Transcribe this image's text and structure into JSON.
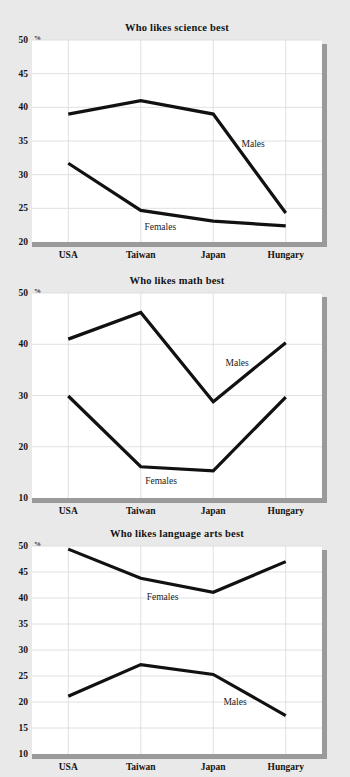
{
  "page": {
    "background_color": "#e9e9e9",
    "plot_background_color": "#ffffff",
    "line_color": "#111111",
    "shadow_color": "#9a9a9a",
    "gridline_color": "#d8d8d8",
    "percent_symbol": "%"
  },
  "chart_data": [
    {
      "type": "line",
      "title": "Who likes science best",
      "xlabel": "",
      "ylabel": "%",
      "categories": [
        "USA",
        "Taiwan",
        "Japan",
        "Hungary"
      ],
      "ylim": [
        20,
        50
      ],
      "yticks": [
        20,
        25,
        30,
        35,
        40,
        45,
        50
      ],
      "grid": true,
      "legend_position": "inline-annotation",
      "series": [
        {
          "name": "Males",
          "values": [
            39,
            41,
            39,
            24.3
          ]
        },
        {
          "name": "Females",
          "values": [
            31.7,
            24.7,
            23.1,
            22.4
          ]
        }
      ],
      "annotations": [
        {
          "text": "Males",
          "x": 2.55,
          "y": 34.6
        },
        {
          "text": "Females",
          "x": 1.27,
          "y": 22.2
        }
      ]
    },
    {
      "type": "line",
      "title": "Who likes math best",
      "xlabel": "",
      "ylabel": "%",
      "categories": [
        "USA",
        "Taiwan",
        "Japan",
        "Hungary"
      ],
      "ylim": [
        10,
        50
      ],
      "yticks": [
        10,
        20,
        30,
        40,
        50
      ],
      "grid": true,
      "legend_position": "inline-annotation",
      "series": [
        {
          "name": "Males",
          "values": [
            41,
            46.2,
            28.8,
            40.3
          ]
        },
        {
          "name": "Females",
          "values": [
            29.9,
            16.1,
            15.3,
            29.7
          ]
        }
      ],
      "annotations": [
        {
          "text": "Males",
          "x": 2.33,
          "y": 36.4
        },
        {
          "text": "Females",
          "x": 1.28,
          "y": 13.4
        }
      ]
    },
    {
      "type": "line",
      "title": "Who likes language arts best",
      "xlabel": "",
      "ylabel": "%",
      "categories": [
        "USA",
        "Taiwan",
        "Japan",
        "Hungary"
      ],
      "ylim": [
        10,
        50
      ],
      "yticks": [
        10,
        15,
        20,
        25,
        30,
        35,
        40,
        45,
        50
      ],
      "grid": true,
      "legend_position": "inline-annotation",
      "series": [
        {
          "name": "Females",
          "values": [
            49.4,
            43.8,
            41.1,
            47.0
          ]
        },
        {
          "name": "Males",
          "values": [
            21.1,
            27.2,
            25.3,
            17.4
          ]
        }
      ],
      "annotations": [
        {
          "text": "Females",
          "x": 1.3,
          "y": 40.2
        },
        {
          "text": "Males",
          "x": 2.3,
          "y": 20.0
        }
      ]
    }
  ]
}
